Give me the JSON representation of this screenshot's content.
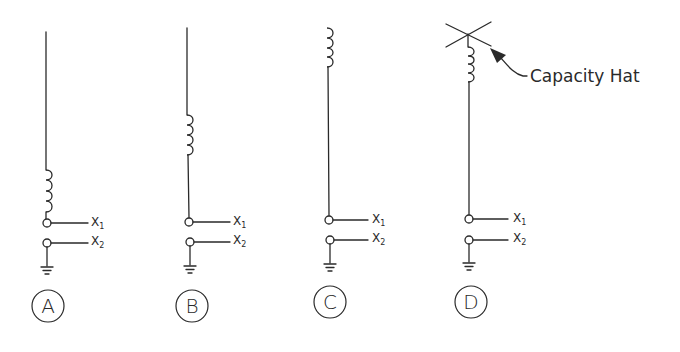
{
  "diagram": {
    "title": "",
    "antennas": [
      {
        "id": "A",
        "label": "A",
        "x": 47,
        "top": 32,
        "coil_top": 170,
        "coil_bottom": 212,
        "term1_y": 223,
        "term2_y": 243,
        "ground_y": 266,
        "label_y": 306,
        "has_capacity_hat": false
      },
      {
        "id": "B",
        "label": "B",
        "x": 189,
        "top": 28,
        "coil_top": 115,
        "coil_bottom": 155,
        "term1_y": 222,
        "term2_y": 242,
        "ground_y": 265,
        "label_y": 306,
        "has_capacity_hat": false
      },
      {
        "id": "C",
        "label": "C",
        "x": 329,
        "top": 28,
        "coil_top": 28,
        "coil_bottom": 67,
        "term1_y": 220,
        "term2_y": 240,
        "ground_y": 263,
        "label_y": 302,
        "has_capacity_hat": false
      },
      {
        "id": "D",
        "label": "D",
        "x": 469,
        "top": 34,
        "coil_top": 47,
        "coil_bottom": 82,
        "term1_y": 219,
        "term2_y": 240,
        "ground_y": 262,
        "label_y": 302,
        "has_capacity_hat": true
      }
    ],
    "terminal_labels": {
      "x1_main": "X",
      "x1_sub": "1",
      "x2_main": "X",
      "x2_sub": "2"
    },
    "annotation": {
      "text": "Capacity Hat",
      "target": "D"
    },
    "colors": {
      "line": "#2a2a2a",
      "background": "#ffffff"
    }
  }
}
